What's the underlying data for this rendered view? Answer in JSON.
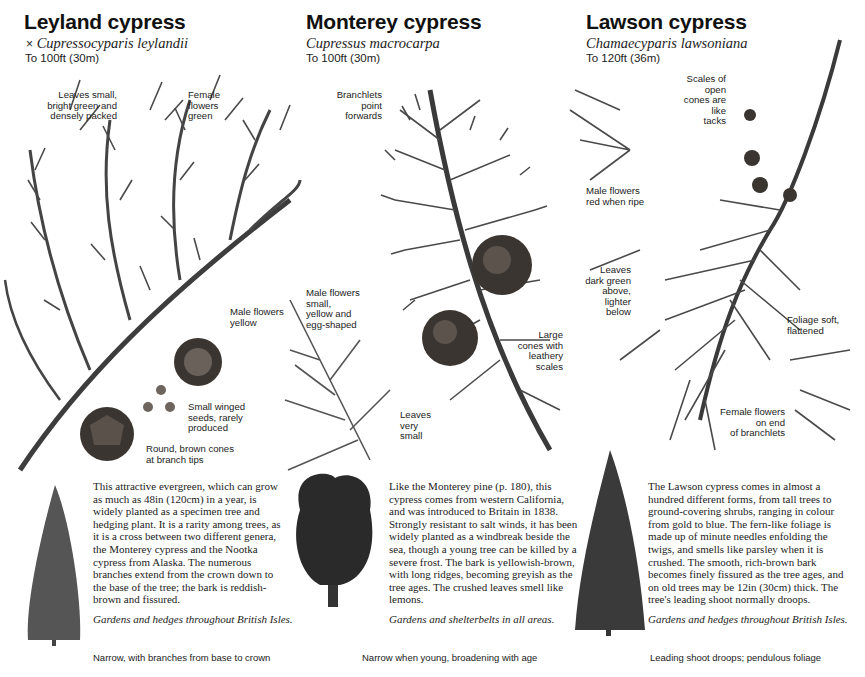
{
  "columns": [
    {
      "id": "leyland",
      "title": "Leyland cypress",
      "latin_prefix": "×",
      "latin": "Cupressocyparis leylandii",
      "height": "To 100ft (30m)",
      "labels": [
        "Leaves small,\nbright green and\ndensely packed",
        "Female\nflowers\ngreen",
        "Male flowers\nyellow",
        "Small winged\nseeds, rarely\nproduced",
        "Round, brown cones\nat branch tips"
      ],
      "description": "This attractive evergreen, which can grow as much as 48in (120cm) in a year, is widely planted as a specimen tree and hedging plant. It is a rarity among trees, as it is a cross between two different genera, the Monterey cypress and the Nootka cypress from Alaska. The numerous branches extend from the crown down to the base of the tree; the bark is reddish-brown and fissured.",
      "habitat": "Gardens and hedges throughout British Isles.",
      "caption": "Narrow, with branches from base to crown"
    },
    {
      "id": "monterey",
      "title": "Monterey cypress",
      "latin": "Cupressus macrocarpa",
      "height": "To 100ft (30m)",
      "labels": [
        "Branchlets\npoint\nforwards",
        "Male flowers\nsmall,\nyellow and\negg-shaped",
        "Large\ncones with\nleathery\nscales",
        "Leaves\nvery\nsmall"
      ],
      "description": "Like the Monterey pine (p. 180), this cypress comes from western California, and was introduced to Britain in 1838. Strongly resistant to salt winds, it has been widely planted as a windbreak beside the sea, though a young tree can be killed by a severe frost. The bark is yellowish-brown, with long ridges, becoming greyish as the tree ages. The crushed leaves smell like lemons.",
      "habitat": "Gardens and shelterbelts in all areas.",
      "caption": "Narrow when young, broadening with age"
    },
    {
      "id": "lawson",
      "title": "Lawson cypress",
      "latin": "Chamaecyparis lawsoniana",
      "height": "To 120ft (36m)",
      "labels": [
        "Scales of\nopen\ncones are\nlike\ntacks",
        "Male flowers\nred when ripe",
        "Leaves\ndark green\nabove,\nlighter\nbelow",
        "Foliage soft,\nflattened",
        "Female flowers\non end\nof branchlets"
      ],
      "description": "The Lawson cypress comes in almost a hundred different forms, from tall trees to ground-covering shrubs, ranging in colour from gold to blue. The fern-like foliage is made up of minute needles enfolding the twigs, and smells like parsley when it is crushed. The smooth, rich-brown bark becomes finely fissured as the tree ages, and on old trees may be 12in (30cm) thick. The tree's leading shoot normally droops.",
      "habitat": "Gardens and hedges throughout British Isles.",
      "caption": "Leading shoot droops; pendulous foliage"
    }
  ],
  "colors": {
    "ink": "#1a1a1a",
    "foliage": "#4a4a4a",
    "cone": "#3a3530",
    "background": "#ffffff"
  }
}
